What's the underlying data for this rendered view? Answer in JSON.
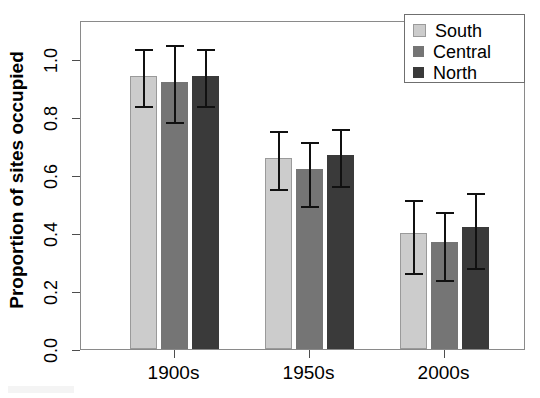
{
  "chart_data": {
    "type": "bar",
    "title": "",
    "subtitle": "",
    "xlabel": "",
    "ylabel": "Proportion of sites occupied",
    "categories": [
      "1900s",
      "1950s",
      "2000s"
    ],
    "ylim": [
      0.0,
      1.135
    ],
    "yticks": [
      "0.0",
      "0.2",
      "0.4",
      "0.6",
      "0.8",
      "1.0"
    ],
    "ytick_values": [
      0.0,
      0.2,
      0.4,
      0.6,
      0.8,
      1.0
    ],
    "grid": false,
    "legend_position": "top-right",
    "error_bars": "asymmetric confidence intervals",
    "series": [
      {
        "name": "South",
        "color": "#cccccc",
        "values": [
          0.94,
          0.66,
          0.4
        ],
        "err_upper": [
          1.04,
          0.76,
          0.52
        ],
        "err_lower": [
          0.845,
          0.56,
          0.27
        ]
      },
      {
        "name": "Central",
        "color": "#757575",
        "values": [
          0.92,
          0.62,
          0.37
        ],
        "err_upper": [
          1.055,
          0.72,
          0.48
        ],
        "err_lower": [
          0.79,
          0.5,
          0.245
        ]
      },
      {
        "name": "North",
        "color": "#3a3a3a",
        "values": [
          0.94,
          0.67,
          0.42
        ],
        "err_upper": [
          1.04,
          0.765,
          0.545
        ],
        "err_lower": [
          0.845,
          0.57,
          0.285
        ]
      }
    ]
  },
  "legend": {
    "items": [
      {
        "label": "South",
        "color": "#cccccc"
      },
      {
        "label": "Central",
        "color": "#757575"
      },
      {
        "label": "North",
        "color": "#3a3a3a"
      }
    ]
  },
  "axis": {
    "y_title": "Proportion of sites occupied",
    "y_tick_labels": [
      "0.0",
      "0.2",
      "0.4",
      "0.6",
      "0.8",
      "1.0"
    ],
    "x_tick_labels": [
      "1900s",
      "1950s",
      "2000s"
    ]
  },
  "colors": {
    "south": "#cccccc",
    "central": "#757575",
    "north": "#3a3a3a",
    "frame": "#8a8a8a",
    "error_bar": "#111111",
    "background": "#ffffff",
    "text": "#000000"
  }
}
